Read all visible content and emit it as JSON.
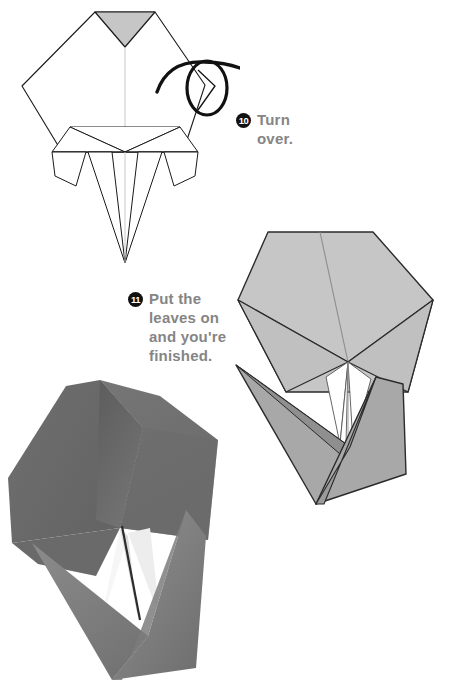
{
  "page": {
    "width": 463,
    "height": 689,
    "background_color": "#ffffff"
  },
  "colors": {
    "text_gray": "#858585",
    "badge_fill": "#111111",
    "badge_text": "#ffffff",
    "line_stroke": "#1a1a1a",
    "crease_stroke": "#9a9a9a",
    "paper_light_gray": "#c6c6c6",
    "paper_mid_gray": "#a8a8a8",
    "paper_shade_gray": "#9b9b9b",
    "paper_tip_gray": "#bdbdbd",
    "photo_paper_dark": "#6e6e6e",
    "photo_paper_darker": "#5d5d5d",
    "photo_paper_mid": "#7b7b7b",
    "photo_paper_light": "#8c8c8c",
    "photo_inner_white": "#f2f2f2",
    "photo_inner_white2": "#e2e2e2",
    "white": "#ffffff"
  },
  "steps": [
    {
      "number": "10",
      "lines": "Turn\nover.",
      "text_plain": "Turn over.",
      "symbol": "turn-over-arrow",
      "position": {
        "left": 236,
        "top": 110
      }
    },
    {
      "number": "11",
      "lines": "Put the\nleaves on\nand you're\nfinished.",
      "text_plain": "Put the leaves on and you're finished.",
      "symbol": "none",
      "position": {
        "left": 128,
        "top": 289
      }
    }
  ],
  "figures": [
    {
      "id": "figure-step10",
      "name": "step-10-diagram",
      "type": "line-diagram",
      "description": "Pentagonal folded base with downward shaded triangle at top, pleated lower flaps and two long pointed petals; turn-over arrow symbol at upper right.",
      "shaded_regions": [
        "top-inverted-triangle"
      ]
    },
    {
      "id": "figure-step11",
      "name": "step-11-diagram",
      "type": "line-diagram",
      "description": "Shaded pentagonal flower head in light gray with darker gray leaves folded below forming a V shape.",
      "shaded_regions": [
        "flower-head",
        "left-leaf",
        "right-leaf",
        "stem-panel"
      ]
    },
    {
      "id": "figure-final",
      "name": "finished-model-photo",
      "type": "photograph",
      "description": "Photograph of the completed dark gray paper flower with leaves attached, shown at an angle on white background."
    }
  ]
}
